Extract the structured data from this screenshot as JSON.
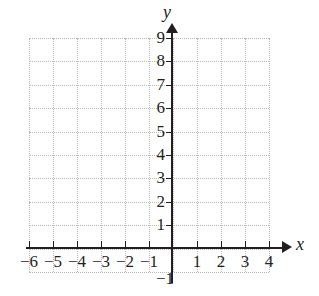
{
  "figure": {
    "type": "coordinate-grid",
    "background_color": "#ffffff",
    "axis_color": "#231f20",
    "grid_color": "#b9b9b9",
    "grid_style": "dotted",
    "x_axis_label": "x",
    "y_axis_label": "y"
  },
  "chart_data": {
    "type": "scatter",
    "title": "",
    "xlabel": "x",
    "ylabel": "y",
    "xlim": [
      -6,
      4
    ],
    "ylim": [
      -1,
      9
    ],
    "xticks": [
      -6,
      -5,
      -4,
      -3,
      -2,
      -1,
      1,
      2,
      3,
      4
    ],
    "yticks": [
      -1,
      1,
      2,
      3,
      4,
      5,
      6,
      7,
      8,
      9
    ],
    "xticklabels": [
      "−6",
      "−5",
      "−4",
      "−3",
      "−2",
      "−1",
      "1",
      "2",
      "3",
      "4"
    ],
    "yticklabels": [
      "−1",
      "1",
      "2",
      "3",
      "4",
      "5",
      "6",
      "7",
      "8",
      "9"
    ],
    "grid": true,
    "legend": null,
    "series": [],
    "x": [],
    "values": [],
    "annotations": []
  },
  "axis_arrows": {
    "x_positive": "arrow-right",
    "y_positive": "arrow-up"
  }
}
